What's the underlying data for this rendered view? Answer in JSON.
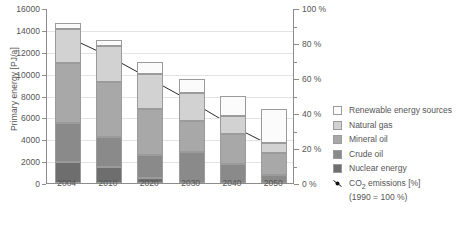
{
  "chart_data": {
    "type": "bar",
    "title": "",
    "categories": [
      "2004",
      "2010",
      "2020",
      "2030",
      "2040",
      "2050"
    ],
    "xlabel": "",
    "ylabel": "Primary energy [PJ/a]",
    "ylim": [
      0,
      16000
    ],
    "ytick_step": 2000,
    "yticks": [
      "0",
      "2000",
      "4000",
      "6000",
      "8000",
      "10000",
      "12000",
      "14000",
      "16000"
    ],
    "y2label": "",
    "y2lim": [
      0,
      100
    ],
    "y2tick_step": 20,
    "y2_minor_step": 10,
    "y2ticks": [
      "0 %",
      "20 %",
      "40 %",
      "60 %",
      "80 %",
      "100 %"
    ],
    "grid": true,
    "legend_position": "right",
    "stacked": true,
    "stack_order_bottom_to_top": [
      "Nuclear energy",
      "Crude oil",
      "Mineral oil",
      "Natural gas",
      "Renewable energy sources"
    ],
    "series": [
      {
        "name": "Nuclear energy",
        "color": "#6e6e6e",
        "values": [
          1950,
          1500,
          450,
          0,
          0,
          0
        ]
      },
      {
        "name": "Crude oil",
        "color": "#8a8a8a",
        "values": [
          3500,
          2750,
          2100,
          2800,
          1750,
          700
        ]
      },
      {
        "name": "Mineral oil",
        "color": "#a8a8a8",
        "values": [
          5550,
          4950,
          4200,
          2900,
          2750,
          2050
        ]
      },
      {
        "name": "Natural gas",
        "color": "#d2d2d2",
        "values": [
          3100,
          3300,
          3250,
          2500,
          1600,
          950
        ]
      },
      {
        "name": "Renewable energy sources",
        "color": "#fbfbfb",
        "values": [
          500,
          600,
          1050,
          1300,
          1900,
          3050
        ]
      }
    ],
    "totals": [
      14600,
      13100,
      11050,
      9500,
      8000,
      6750
    ],
    "line_series": {
      "name": "CO2 emissions [%]",
      "note": "(1990 = 100 %)",
      "color": "#111111",
      "axis": "right",
      "values": [
        84,
        73,
        60,
        47,
        33,
        21
      ],
      "marker": "filled-circle"
    }
  },
  "axes": {
    "y_left_title": "Primary energy [PJ/a]",
    "y_left_ticks": [
      "16000",
      "14000",
      "12000",
      "10000",
      "8000",
      "6000",
      "4000",
      "2000",
      "0"
    ],
    "y_right_ticks": [
      "100 %",
      "80 %",
      "60 %",
      "40 %",
      "20 %",
      "0 %"
    ],
    "x_ticks": [
      "2004",
      "2010",
      "2020",
      "2030",
      "2040",
      "2050"
    ]
  },
  "legend": {
    "items": [
      {
        "label": "Renewable energy sources",
        "color": "#fbfbfb"
      },
      {
        "label": "Natural gas",
        "color": "#d2d2d2"
      },
      {
        "label": "Mineral oil",
        "color": "#a8a8a8"
      },
      {
        "label": "Crude oil",
        "color": "#8a8a8a"
      },
      {
        "label": "Nuclear energy",
        "color": "#6e6e6e"
      }
    ],
    "co2_label_main": "CO",
    "co2_label_sub": "2",
    "co2_label_rest": " emissions [%]",
    "co2_label_note": "(1990 = 100 %)"
  },
  "colors": {
    "axis": "#8c8c8c",
    "grid": "#e3e3e3",
    "text": "#555555",
    "line": "#111111"
  }
}
